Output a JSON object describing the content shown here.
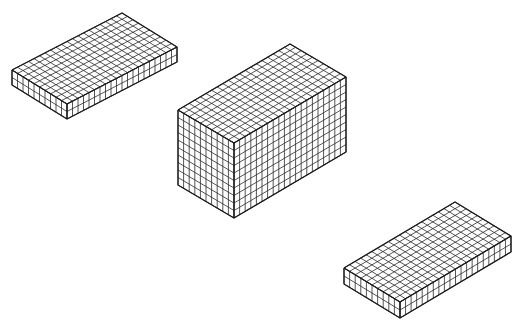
{
  "diagram": {
    "line_color": "#2a2a2a",
    "background": "#ffffff",
    "blocks": [
      {
        "name": "flat-block-top-left",
        "cubes_left_face": 10,
        "cubes_right_face": 20,
        "cubes_height": 2,
        "left_corner": [
          12,
          70
        ],
        "front_top_corner": [
          67,
          104
        ],
        "back_top_corner": [
          122,
          13
        ],
        "height_px": 15
      },
      {
        "name": "tall-block-center",
        "cubes_left_face": 10,
        "cubes_right_face": 20,
        "cubes_height": 10,
        "left_corner": [
          178,
          110
        ],
        "front_top_corner": [
          234,
          143
        ],
        "back_top_corner": [
          290,
          44
        ],
        "height_px": 75
      },
      {
        "name": "flat-block-bottom-right",
        "cubes_left_face": 10,
        "cubes_right_face": 20,
        "cubes_height": 2,
        "left_corner": [
          344,
          268
        ],
        "front_top_corner": [
          400,
          302
        ],
        "back_top_corner": [
          455,
          202
        ],
        "height_px": 16
      }
    ]
  }
}
